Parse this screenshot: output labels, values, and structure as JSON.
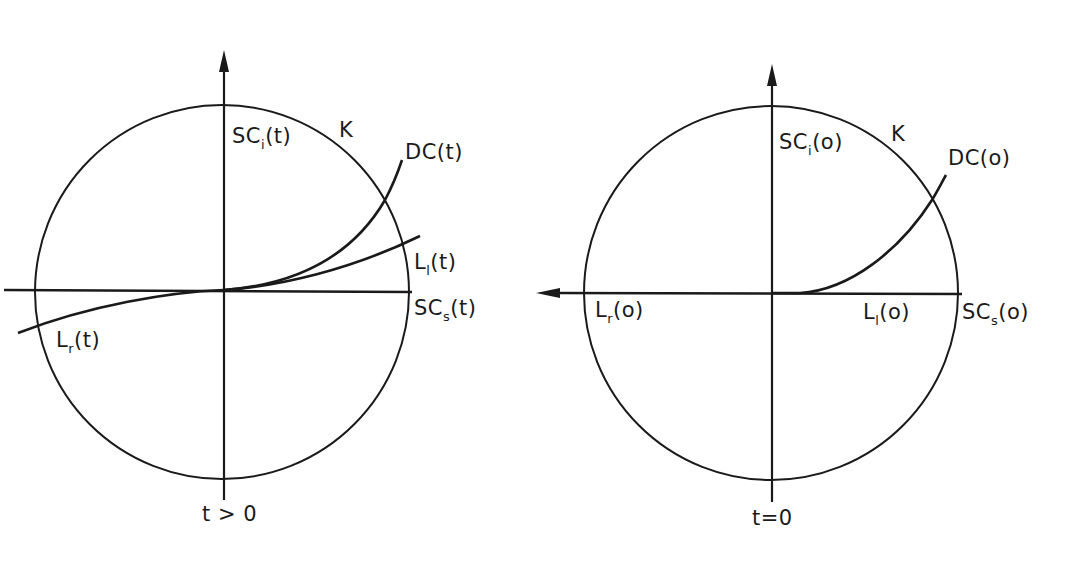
{
  "figure": {
    "colors": {
      "ink": "#1a1a1a",
      "background": "#ffffff"
    },
    "left_panel": {
      "condition": "t > 0",
      "circle_label": "K",
      "labels": {
        "sc_i": {
          "base": "SC",
          "sub": "i",
          "arg": "(t)"
        },
        "dc": "DC(t)",
        "l_l": {
          "base": "L",
          "sub": "l",
          "arg": "(t)"
        },
        "sc_s": {
          "base": "SC",
          "sub": "s",
          "arg": "(t)"
        },
        "l_r": {
          "base": "L",
          "sub": "r",
          "arg": "(t)"
        }
      }
    },
    "right_panel": {
      "condition": "t=0",
      "circle_label": "K",
      "labels": {
        "sc_i": {
          "base": "SC",
          "sub": "i",
          "arg": "(o)"
        },
        "dc": "DC(o)",
        "l_r": {
          "base": "L",
          "sub": "r",
          "arg": "(o)"
        },
        "l_l": {
          "base": "L",
          "sub": "l",
          "arg": "(o)"
        },
        "sc_s": {
          "base": "SC",
          "sub": "s",
          "arg": "(o)"
        }
      }
    }
  }
}
